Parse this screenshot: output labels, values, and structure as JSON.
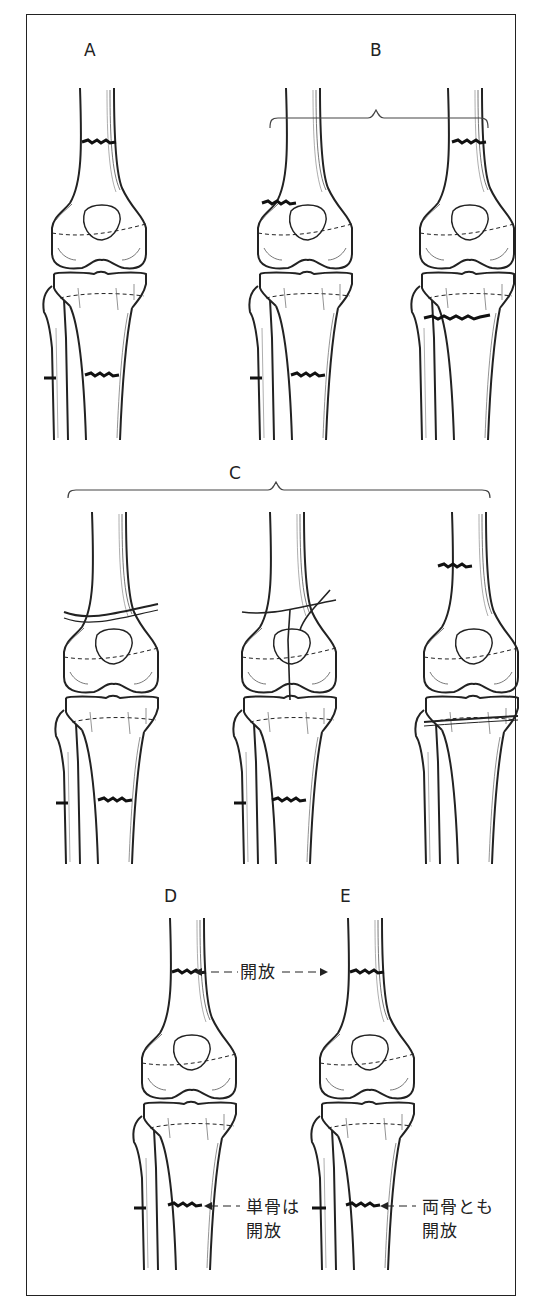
{
  "figure": {
    "type": "anatomical-diagram",
    "groups": [
      {
        "id": "A",
        "label": "A",
        "panels": 1,
        "description": "femoral shaft fracture + tibial & fibular shaft fractures"
      },
      {
        "id": "B",
        "label": "B",
        "panels": 2,
        "description": "distal femoral metaphyseal fracture + tibia/fibula fractures; femoral shaft + proximal tibial metaphyseal fracture"
      },
      {
        "id": "C",
        "label": "C",
        "panels": 3,
        "description": "intra-articular distal femur fracture; T/Y-type condylar fracture; femoral shaft + tibial plateau fracture"
      },
      {
        "id": "D",
        "label": "D",
        "panels": 1,
        "description": "open femur fracture, tibia single-bone open"
      },
      {
        "id": "E",
        "label": "E",
        "panels": 1,
        "description": "open femur fracture, both bones open"
      }
    ],
    "annotations": {
      "open": "開放",
      "single_bone_open_line1": "単骨は",
      "single_bone_open_line2": "開放",
      "both_bones_open_line1": "両骨とも",
      "both_bones_open_line2": "開放"
    },
    "colors": {
      "line": "#222222",
      "background": "#ffffff"
    }
  }
}
